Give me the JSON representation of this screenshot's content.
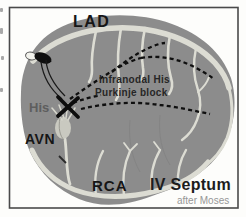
{
  "figure": {
    "artery_labels": {
      "lad": "LAD",
      "rca": "RCA"
    },
    "conduction_labels": {
      "his": "His",
      "avn": "AVN"
    },
    "annotation": {
      "line1": "Infranodal His",
      "line2": "Purkinje block"
    },
    "title": "IV Septum",
    "credit": "after Moses",
    "colors": {
      "septum": "#8c8c8c",
      "artery": "#dcdcd3",
      "canvas": "#fdfdfb",
      "frame": "#4a4a4a",
      "pathway": "#0f0f0f",
      "his_text": "#5e5e5e",
      "credit_text": "#979797",
      "label_text": "#161616"
    }
  }
}
